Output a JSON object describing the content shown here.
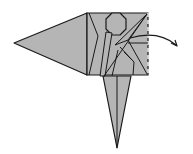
{
  "diagram": {
    "type": "origami-fold-step",
    "colors": {
      "paper": "#b5b5b5",
      "line": "#1a1a1a",
      "background": "#ffffff"
    },
    "arrow": {
      "direction": "right",
      "meaning": "unfold-flap"
    }
  }
}
